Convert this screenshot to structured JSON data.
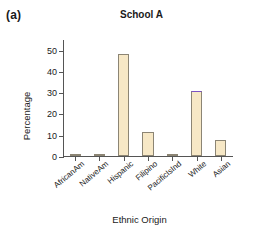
{
  "panel": {
    "label": "(a)"
  },
  "chart_data": {
    "type": "bar",
    "title": "School A",
    "xlabel": "Ethnic Origin",
    "ylabel": "Percentage",
    "ylim": [
      0,
      55
    ],
    "yticks": [
      0,
      10,
      20,
      30,
      40,
      50
    ],
    "ytick_labels": [
      "0",
      "10",
      "20",
      "30",
      "40",
      "50"
    ],
    "grid": false,
    "legend": null,
    "categories": [
      "AfricanAm",
      "NativeAm",
      "Hispanic",
      "Filipino",
      "PacificIsInd",
      "White",
      "Asian"
    ],
    "values": [
      1.0,
      0.8,
      48.0,
      11.5,
      0.3,
      30.5,
      7.5
    ],
    "bar_color": "#f7e8c6",
    "bar_edge_color": "#8c8574",
    "highlight_cap_color": "#7b52c4",
    "highlight_cap_category": "White"
  }
}
